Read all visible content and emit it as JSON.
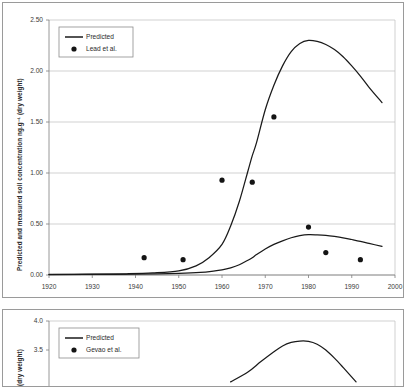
{
  "figure": {
    "panel_count": 2,
    "background": "#ffffff",
    "border_color": "#9a9a9a"
  },
  "chart_data": [
    {
      "id": "top-chart",
      "type": "line",
      "title": "",
      "xlabel": "",
      "ylabel": "Predicted and measured soil concentration ng.g⁻¹ (dry weight)",
      "xlim": [
        1920,
        2000
      ],
      "ylim": [
        0.0,
        2.5
      ],
      "xticks": [
        1920,
        1930,
        1940,
        1950,
        1960,
        1970,
        1980,
        1990,
        2000
      ],
      "xticklabels": [
        "1920",
        "1930",
        "1940",
        "1950",
        "1960",
        "1970",
        "1980",
        "1990",
        "2000"
      ],
      "yticks": [
        0.0,
        0.5,
        1.0,
        1.5,
        2.0,
        2.5
      ],
      "yticklabels": [
        "0.00",
        "0.50",
        "1.00",
        "1.50",
        "2.00",
        "2.50"
      ],
      "grid": false,
      "legend_position": "top-left",
      "legend": [
        {
          "label": "Predicted",
          "marker": "line",
          "color": "#1a1a1a"
        },
        {
          "label": "Lead et al.",
          "marker": "dot",
          "color": "#141414"
        }
      ],
      "series": [
        {
          "name": "Predicted upper",
          "kind": "line",
          "x": [
            1920,
            1930,
            1938,
            1944,
            1950,
            1954,
            1957,
            1960,
            1962,
            1964,
            1966,
            1967,
            1968,
            1970,
            1972,
            1974,
            1976,
            1978,
            1980,
            1982,
            1984,
            1986,
            1988,
            1990,
            1992,
            1994,
            1997
          ],
          "y": [
            0.005,
            0.008,
            0.012,
            0.02,
            0.04,
            0.09,
            0.17,
            0.3,
            0.48,
            0.72,
            1.02,
            1.17,
            1.3,
            1.62,
            1.86,
            2.05,
            2.19,
            2.27,
            2.3,
            2.29,
            2.26,
            2.21,
            2.14,
            2.05,
            1.95,
            1.84,
            1.69
          ]
        },
        {
          "name": "Predicted lower",
          "kind": "line",
          "x": [
            1920,
            1935,
            1945,
            1950,
            1955,
            1958,
            1960,
            1962,
            1964,
            1966,
            1967,
            1968,
            1970,
            1972,
            1974,
            1976,
            1978,
            1980,
            1982,
            1984,
            1986,
            1988,
            1990,
            1992,
            1994,
            1997
          ],
          "y": [
            0.004,
            0.006,
            0.01,
            0.015,
            0.025,
            0.038,
            0.05,
            0.07,
            0.1,
            0.145,
            0.17,
            0.2,
            0.255,
            0.3,
            0.335,
            0.365,
            0.385,
            0.395,
            0.393,
            0.388,
            0.378,
            0.365,
            0.348,
            0.33,
            0.31,
            0.28
          ]
        },
        {
          "name": "Lead et al.",
          "kind": "scatter",
          "points": [
            {
              "x": 1942,
              "y": 0.17
            },
            {
              "x": 1951,
              "y": 0.15
            },
            {
              "x": 1960,
              "y": 0.93
            },
            {
              "x": 1967,
              "y": 0.91
            },
            {
              "x": 1972,
              "y": 1.55
            },
            {
              "x": 1980,
              "y": 0.47
            },
            {
              "x": 1984,
              "y": 0.22
            },
            {
              "x": 1992,
              "y": 0.15
            }
          ]
        }
      ]
    },
    {
      "id": "bottom-chart",
      "type": "line",
      "title": "",
      "xlabel": "",
      "ylabel": "(dry weight)",
      "xlim": [
        1920,
        2000
      ],
      "ylim": [
        3.0,
        4.0
      ],
      "yticks": [
        3.5,
        4.0
      ],
      "yticklabels": [
        "3.5",
        "4.0"
      ],
      "xticks": [],
      "xticklabels": [],
      "grid": false,
      "cropped": true,
      "legend_position": "top-left",
      "legend": [
        {
          "label": "Predicted",
          "marker": "line",
          "color": "#1a1a1a"
        },
        {
          "label": "Gevao et al.",
          "marker": "dot",
          "color": "#141414"
        }
      ],
      "series": [
        {
          "name": "Predicted",
          "kind": "line",
          "x": [
            1962,
            1966,
            1969,
            1972,
            1974,
            1976,
            1978,
            1980,
            1982,
            1984,
            1986,
            1988,
            1991
          ],
          "y": [
            2.95,
            3.12,
            3.3,
            3.47,
            3.57,
            3.63,
            3.655,
            3.65,
            3.6,
            3.5,
            3.36,
            3.2,
            2.95
          ]
        }
      ]
    }
  ]
}
